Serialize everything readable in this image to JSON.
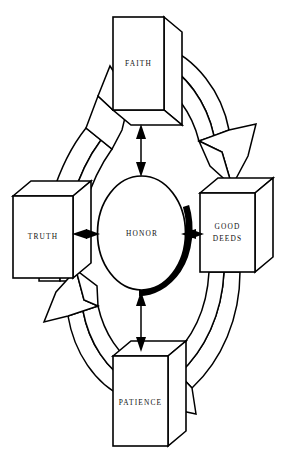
{
  "diagram": {
    "type": "cycle-diagram",
    "background_color": "#ffffff",
    "line_color": "#000000",
    "center": {
      "name": "center-node",
      "label": "HONOR",
      "shape": "ellipse",
      "has_drop_shadow": true
    },
    "nodes": [
      {
        "id": "faith",
        "label": "FAITH",
        "position": "top",
        "shape": "3d-box"
      },
      {
        "id": "good-deeds",
        "label_line1": "GOOD",
        "label_line2": "DEEDS",
        "label": "GOOD DEEDS",
        "position": "right",
        "shape": "3d-box"
      },
      {
        "id": "patience",
        "label": "PATIENCE",
        "position": "bottom",
        "shape": "3d-box"
      },
      {
        "id": "truth",
        "label": "TRUTH",
        "position": "left",
        "shape": "3d-box"
      }
    ],
    "spoke_connectors": [
      {
        "id": "faith-honor",
        "from": "faith",
        "to": "center",
        "style": "double-headed-arrow",
        "orientation": "vertical"
      },
      {
        "id": "truth-honor",
        "from": "truth",
        "to": "center",
        "style": "double-headed-arrow",
        "orientation": "horizontal"
      },
      {
        "id": "honor-good-deeds",
        "from": "center",
        "to": "good-deeds",
        "style": "double-headed-arrow",
        "orientation": "horizontal"
      },
      {
        "id": "honor-patience",
        "from": "center",
        "to": "patience",
        "style": "double-headed-arrow",
        "orientation": "vertical"
      }
    ],
    "cycle_arrows": [
      {
        "id": "truth-to-faith",
        "from": "truth",
        "to": "faith",
        "direction": "clockwise",
        "quadrant": "top-left",
        "style": "3d-curved-block-arrow"
      },
      {
        "id": "faith-to-good-deeds",
        "from": "faith",
        "to": "good-deeds",
        "direction": "clockwise",
        "quadrant": "top-right",
        "style": "3d-curved-block-arrow"
      },
      {
        "id": "good-deeds-to-patience",
        "from": "good-deeds",
        "to": "patience",
        "direction": "clockwise",
        "quadrant": "bottom-right",
        "style": "3d-curved-block-arrow"
      },
      {
        "id": "patience-to-truth",
        "from": "patience",
        "to": "truth",
        "direction": "clockwise",
        "quadrant": "bottom-left",
        "style": "3d-curved-block-arrow"
      }
    ]
  }
}
